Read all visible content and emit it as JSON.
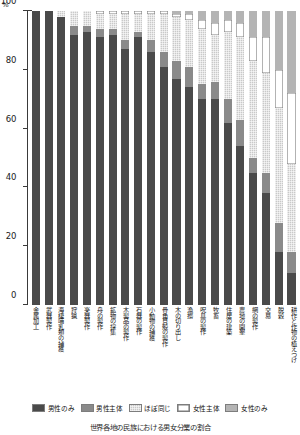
{
  "chart_data": {
    "type": "bar",
    "subtype": "stacked-percentage",
    "title": "",
    "caption": "世界各地の民族における男女分業の割合",
    "xlabel": "",
    "ylabel": "",
    "yunit": "%",
    "ylim": [
      0,
      100
    ],
    "yticks": [
      0,
      20,
      40,
      60,
      80,
      100
    ],
    "ytick_labels": [
      "0",
      "20",
      "40",
      "60",
      "80",
      "100"
    ],
    "grid": false,
    "legend_position": "bottom",
    "categories": [
      "金属加工",
      "武器製作",
      "海棲哺乳類の捕獲",
      "狩猟",
      "楽器製作",
      "舟の製作",
      "鉱物の採集",
      "木製品の製作",
      "石器の製作",
      "小動物の捕獲",
      "骨角貝殻の製作",
      "木の切り出し",
      "漁撈",
      "呪具の製作",
      "牧畜",
      "住居の建築",
      "農地の開墾",
      "網の製作",
      "交易",
      "脱穀",
      "耕作と作物の植えつけ"
    ],
    "series": [
      {
        "name": "男性のみ",
        "color": "#4a4a4a",
        "values": [
          100,
          100,
          98,
          92,
          93,
          91,
          92,
          87,
          91,
          86,
          81,
          77,
          74,
          70,
          70,
          62,
          54,
          45,
          38,
          18,
          11
        ]
      },
      {
        "name": "男性主体",
        "color": "#8a8a8a",
        "values": [
          0,
          0,
          0,
          3,
          2,
          3,
          2,
          3,
          2,
          4,
          5,
          6,
          7,
          5,
          6,
          8,
          9,
          5,
          7,
          10,
          7
        ]
      },
      {
        "name": "ほぼ同じ",
        "color": "#c9c9c9",
        "values": [
          0,
          0,
          2,
          5,
          5,
          5,
          5,
          9,
          6,
          9,
          13,
          15,
          16,
          19,
          16,
          23,
          28,
          33,
          34,
          39,
          30
        ]
      },
      {
        "name": "女性主体",
        "color": "#ffffff",
        "values": [
          0,
          0,
          0,
          0,
          0,
          1,
          1,
          1,
          1,
          1,
          1,
          1,
          2,
          3,
          4,
          4,
          5,
          8,
          12,
          13,
          24
        ]
      },
      {
        "name": "女性のみ",
        "color": "#b4b4b4",
        "values": [
          0,
          0,
          0,
          0,
          0,
          0,
          0,
          0,
          0,
          0,
          0,
          1,
          1,
          3,
          4,
          3,
          4,
          9,
          9,
          20,
          28
        ]
      }
    ]
  },
  "legend": {
    "items": [
      {
        "label": "男性のみ",
        "swatch": "s-male-only"
      },
      {
        "label": "男性主体",
        "swatch": "s-male-main"
      },
      {
        "label": "ほぼ同じ",
        "swatch": "s-equal"
      },
      {
        "label": "女性主体",
        "swatch": "s-female-main"
      },
      {
        "label": "女性のみ",
        "swatch": "s-female-only"
      }
    ]
  }
}
